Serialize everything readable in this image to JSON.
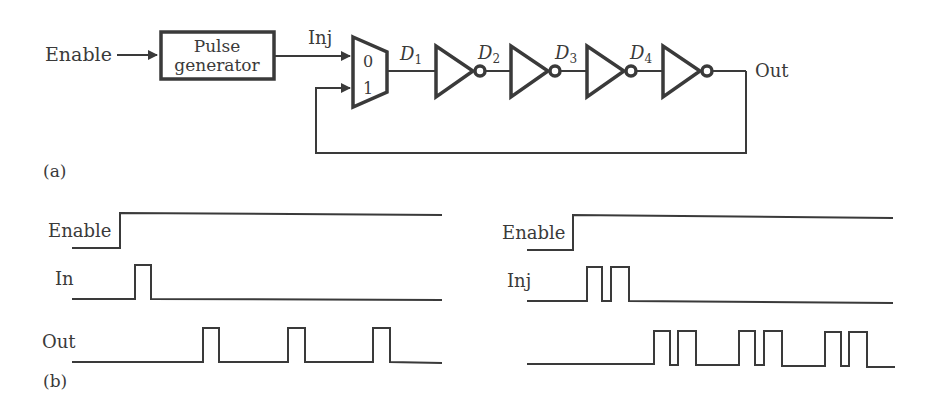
{
  "circuit": {
    "label": "(a)",
    "enable_label": "Enable",
    "pulse_generator": {
      "line1": "Pulse",
      "line2": "generator"
    },
    "inj_label": "Inj",
    "mux": {
      "input0": "0",
      "input1": "1"
    },
    "nodes": [
      {
        "name": "D",
        "sub": "1"
      },
      {
        "name": "D",
        "sub": "2"
      },
      {
        "name": "D",
        "sub": "3"
      },
      {
        "name": "D",
        "sub": "4"
      }
    ],
    "out_label": "Out",
    "inverter_count": 4
  },
  "timing": {
    "label": "(b)",
    "left": {
      "signals": [
        "Enable",
        "In",
        "Out"
      ]
    },
    "right": {
      "signals": [
        "Enable",
        "Inj",
        ""
      ]
    }
  }
}
